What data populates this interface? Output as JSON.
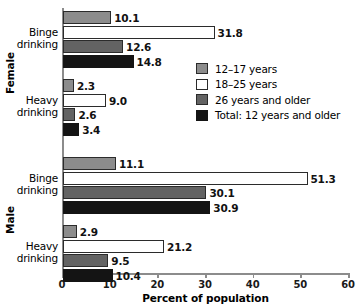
{
  "chart_data": {
    "type": "bar",
    "orientation": "horizontal",
    "title": "",
    "xlabel": "Percent of population",
    "ylabel": "",
    "xlim": [
      0,
      60
    ],
    "xticks": [
      0,
      10,
      20,
      30,
      40,
      50,
      60
    ],
    "xticklabels": [
      "0",
      "10",
      "20",
      "30",
      "40",
      "50",
      "60"
    ],
    "grid": false,
    "legend_position": "upper-right",
    "series": [
      {
        "name": "12–17 years",
        "color": "#8c8c8c",
        "values": [
          10.1,
          2.3,
          11.1,
          2.9
        ]
      },
      {
        "name": "18–25 years",
        "color": "#ffffff",
        "values": [
          31.8,
          9.0,
          51.3,
          21.2
        ]
      },
      {
        "name": "26 years and older",
        "color": "#636363",
        "values": [
          12.6,
          2.6,
          30.1,
          9.5
        ]
      },
      {
        "name": "Total: 12 years and older",
        "color": "#141414",
        "values": [
          14.8,
          3.4,
          30.9,
          10.4
        ]
      }
    ],
    "categories": [
      "Binge drinking",
      "Heavy drinking",
      "Binge drinking",
      "Heavy drinking"
    ],
    "groups": [
      {
        "label": "Female",
        "categories": [
          "Binge drinking",
          "Heavy drinking"
        ]
      },
      {
        "label": "Male",
        "categories": [
          "Binge drinking",
          "Heavy drinking"
        ]
      }
    ]
  },
  "axis": {
    "xlabel": "Percent of population",
    "ticks": [
      "0",
      "10",
      "20",
      "30",
      "40",
      "50",
      "60"
    ]
  },
  "groups": [
    {
      "label": "Female",
      "blocks": [
        {
          "label_line1": "Binge",
          "label_line2": "drinking",
          "bars": [
            {
              "series": "12–17 years",
              "value": 10.1,
              "label": "10.1"
            },
            {
              "series": "18–25 years",
              "value": 31.8,
              "label": "31.8"
            },
            {
              "series": "26 years and older",
              "value": 12.6,
              "label": "12.6"
            },
            {
              "series": "Total: 12 years and older",
              "value": 14.8,
              "label": "14.8"
            }
          ]
        },
        {
          "label_line1": "Heavy",
          "label_line2": "drinking",
          "bars": [
            {
              "series": "12–17 years",
              "value": 2.3,
              "label": "2.3"
            },
            {
              "series": "18–25 years",
              "value": 9.0,
              "label": "9.0"
            },
            {
              "series": "26 years and older",
              "value": 2.6,
              "label": "2.6"
            },
            {
              "series": "Total: 12 years and older",
              "value": 3.4,
              "label": "3.4"
            }
          ]
        }
      ]
    },
    {
      "label": "Male",
      "blocks": [
        {
          "label_line1": "Binge",
          "label_line2": "drinking",
          "bars": [
            {
              "series": "12–17 years",
              "value": 11.1,
              "label": "11.1"
            },
            {
              "series": "18–25 years",
              "value": 51.3,
              "label": "51.3"
            },
            {
              "series": "26 years and older",
              "value": 30.1,
              "label": "30.1"
            },
            {
              "series": "Total: 12 years and older",
              "value": 30.9,
              "label": "30.9"
            }
          ]
        },
        {
          "label_line1": "Heavy",
          "label_line2": "drinking",
          "bars": [
            {
              "series": "12–17 years",
              "value": 2.9,
              "label": "2.9"
            },
            {
              "series": "18–25 years",
              "value": 21.2,
              "label": "21.2"
            },
            {
              "series": "26 years and older",
              "value": 9.5,
              "label": "9.5"
            },
            {
              "series": "Total: 12 years and older",
              "value": 10.4,
              "label": "10.4"
            }
          ]
        }
      ]
    }
  ],
  "legend": {
    "items": [
      {
        "label": "12–17 years",
        "color": "#8c8c8c"
      },
      {
        "label": "18–25 years",
        "color": "#ffffff"
      },
      {
        "label": "26 years and older",
        "color": "#636363"
      },
      {
        "label": "Total: 12 years and older",
        "color": "#141414"
      }
    ]
  }
}
